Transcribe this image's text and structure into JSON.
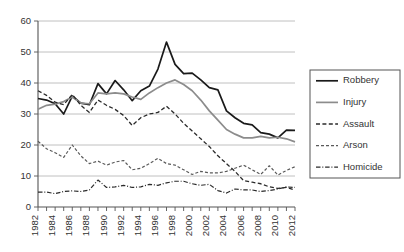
{
  "chart_data": {
    "type": "line",
    "title": "",
    "subtitle": "",
    "xlabel": "",
    "ylabel": "",
    "xlim": [
      1982,
      2012
    ],
    "ylim": [
      0,
      60
    ],
    "ytick_values": [
      0,
      10,
      20,
      30,
      40,
      50,
      60
    ],
    "ytick_labels": [
      "0",
      "10",
      "20",
      "30",
      "40",
      "50",
      "60"
    ],
    "xtick_values": [
      1982,
      1984,
      1986,
      1988,
      1990,
      1992,
      1994,
      1996,
      1998,
      2000,
      2002,
      2004,
      2006,
      2008,
      2010,
      2012
    ],
    "xtick_labels": [
      "1982",
      "1984",
      "1986",
      "1988",
      "1990",
      "1992",
      "1994",
      "1996",
      "1998",
      "2000",
      "2002",
      "2004",
      "2006",
      "2008",
      "2010",
      "2012"
    ],
    "xtick_minor_values": [
      1982,
      1983,
      1984,
      1985,
      1986,
      1987,
      1988,
      1989,
      1990,
      1991,
      1992,
      1993,
      1994,
      1995,
      1996,
      1997,
      1998,
      1999,
      2000,
      2001,
      2002,
      2003,
      2004,
      2005,
      2006,
      2007,
      2008,
      2009,
      2010,
      2011,
      2012
    ],
    "x": [
      1982,
      1983,
      1984,
      1985,
      1986,
      1987,
      1988,
      1989,
      1990,
      1991,
      1992,
      1993,
      1994,
      1995,
      1996,
      1997,
      1998,
      1999,
      2000,
      2001,
      2002,
      2003,
      2004,
      2005,
      2006,
      2007,
      2008,
      2009,
      2010,
      2011,
      2012
    ],
    "grid": true,
    "grid_axis": "y",
    "legend_position": "right",
    "series": [
      {
        "name": "Robbery",
        "style": "solid",
        "color": "#1a1a1a",
        "width": 1.7,
        "values": [
          35.0,
          34.5,
          33.3,
          30.0,
          35.8,
          33.5,
          33.0,
          39.8,
          36.5,
          40.8,
          37.8,
          34.3,
          37.5,
          39.0,
          44.5,
          53.2,
          46.0,
          43.0,
          43.2,
          41.0,
          38.5,
          37.8,
          31.0,
          28.8,
          27.0,
          26.5,
          24.0,
          23.5,
          22.3,
          24.8,
          24.7
        ]
      },
      {
        "name": "Injury",
        "style": "solid",
        "color": "#8c8c8c",
        "width": 1.7,
        "values": [
          31.5,
          32.8,
          33.2,
          34.0,
          35.5,
          33.5,
          33.3,
          36.8,
          36.5,
          36.8,
          36.5,
          35.5,
          34.7,
          36.8,
          38.5,
          40.0,
          41.0,
          39.5,
          37.5,
          34.5,
          31.0,
          28.0,
          25.0,
          23.5,
          22.3,
          22.3,
          22.8,
          22.3,
          22.5,
          22.0,
          21.0
        ]
      },
      {
        "name": "Assault",
        "style": "dashed",
        "color": "#2b2b2b",
        "width": 1.3,
        "values": [
          37.5,
          36.0,
          33.8,
          33.0,
          36.3,
          32.8,
          30.5,
          34.5,
          32.8,
          31.5,
          29.5,
          26.3,
          28.8,
          30.0,
          30.5,
          32.5,
          30.0,
          27.0,
          24.5,
          22.0,
          19.5,
          16.5,
          14.0,
          11.5,
          8.5,
          8.0,
          7.5,
          6.5,
          6.0,
          6.3,
          5.5
        ]
      },
      {
        "name": "Arson",
        "style": "fine-dashed",
        "color": "#5a5a5a",
        "width": 1.2,
        "values": [
          21.2,
          18.8,
          17.5,
          16.0,
          20.0,
          16.5,
          14.0,
          14.8,
          13.5,
          14.5,
          15.0,
          12.0,
          12.5,
          14.0,
          15.7,
          14.0,
          13.5,
          12.0,
          10.5,
          11.5,
          11.0,
          11.0,
          11.5,
          12.5,
          13.5,
          12.0,
          10.5,
          13.3,
          10.3,
          11.8,
          13.0
        ]
      },
      {
        "name": "Homicide",
        "style": "dash-dot",
        "color": "#2b2b2b",
        "width": 1.2,
        "values": [
          4.8,
          4.8,
          4.3,
          5.0,
          5.2,
          5.0,
          5.5,
          8.7,
          6.3,
          6.5,
          7.0,
          6.3,
          6.5,
          7.3,
          7.0,
          7.8,
          8.3,
          8.3,
          7.5,
          7.0,
          7.3,
          5.3,
          4.5,
          5.8,
          5.5,
          5.5,
          5.0,
          5.3,
          5.8,
          6.5,
          6.3
        ]
      }
    ]
  },
  "legend": {
    "items": [
      {
        "label": "Robbery"
      },
      {
        "label": "Injury"
      },
      {
        "label": "Assault"
      },
      {
        "label": "Arson"
      },
      {
        "label": "Homicide"
      }
    ]
  }
}
